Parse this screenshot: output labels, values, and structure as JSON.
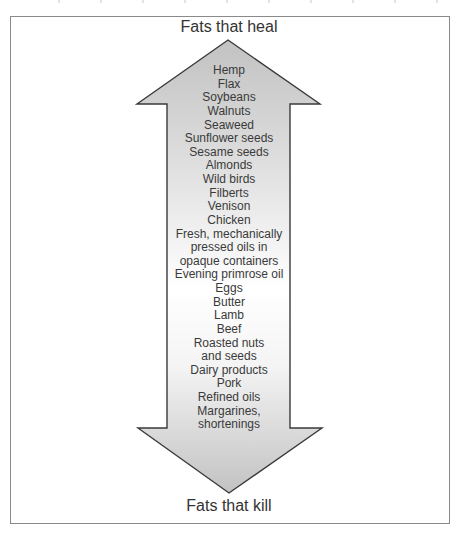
{
  "diagram": {
    "type": "double-headed-vertical-arrow",
    "top_label": "Fats that heal",
    "bottom_label": "Fats that kill",
    "items": [
      "Hemp",
      "Flax",
      "Soybeans",
      "Walnuts",
      "Seaweed",
      "Sunflower seeds",
      "Sesame seeds",
      "Almonds",
      "Wild birds",
      "Filberts",
      "Venison",
      "Chicken",
      "Fresh, mechanically",
      "pressed oils in",
      "opaque containers",
      "Evening primrose oil",
      "Eggs",
      "Butter",
      "Lamb",
      "Beef",
      "Roasted nuts",
      "and seeds",
      "Dairy products",
      "Pork",
      "Refined oils",
      "Margarines,",
      "shortenings"
    ],
    "colors": {
      "arrow_fill_dark": "#c4c4c4",
      "arrow_fill_light": "#ffffff",
      "arrow_stroke": "#3a3a3a",
      "frame_border": "#8a8a8a",
      "text": "#333333"
    }
  }
}
